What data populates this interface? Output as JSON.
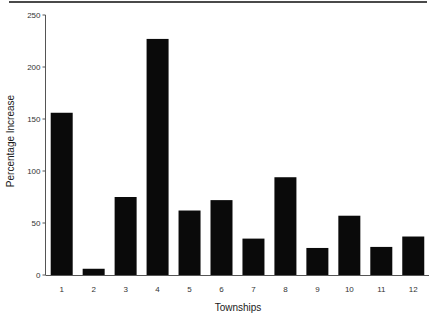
{
  "chart_data": {
    "type": "bar",
    "title": "",
    "xlabel": "Townships",
    "ylabel": "Percentage Increase",
    "categories": [
      "1",
      "2",
      "3",
      "4",
      "5",
      "6",
      "7",
      "8",
      "9",
      "10",
      "11",
      "12"
    ],
    "values": [
      156,
      6,
      75,
      227,
      62,
      72,
      35,
      94,
      26,
      57,
      27,
      37
    ],
    "ylim": [
      0,
      250
    ],
    "yticks": [
      0,
      50,
      100,
      150,
      200,
      250
    ],
    "grid": false,
    "legend": null,
    "bar_color": "#0a0a0a"
  },
  "axes": {
    "x_title": "Townships",
    "y_title": "Percentage Increase",
    "y_tick_labels": [
      "0",
      "50",
      "100",
      "150",
      "200",
      "250"
    ],
    "x_tick_labels": [
      "1",
      "2",
      "3",
      "4",
      "5",
      "6",
      "7",
      "8",
      "9",
      "10",
      "11",
      "12"
    ]
  }
}
